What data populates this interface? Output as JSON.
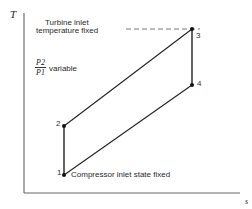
{
  "diagram": {
    "type": "T-s diagram, Brayton cycle",
    "axes": {
      "y_label": "T",
      "x_label": "s"
    },
    "annotations": {
      "turbine_line1": "Turbine inlet",
      "turbine_line2": "temperature fixed",
      "ratio_num": "P2",
      "ratio_den": "P1",
      "ratio_text": "variable",
      "compressor": "Compressor inlet state fixed"
    },
    "points": [
      {
        "id": "1",
        "label": "1"
      },
      {
        "id": "2",
        "label": "2"
      },
      {
        "id": "3",
        "label": "3"
      },
      {
        "id": "4",
        "label": "4"
      }
    ],
    "colors": {
      "line": "#222222",
      "axis": "#555555"
    }
  }
}
